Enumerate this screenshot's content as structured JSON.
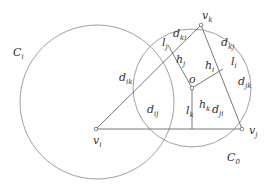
{
  "diagram": {
    "colors": {
      "stroke": "#555555",
      "circle": "#888888",
      "text": "#333333",
      "background": "#ffffff"
    },
    "circles": [
      {
        "id": "C_i",
        "label": "C",
        "sub": "i",
        "cx": 97,
        "cy": 102,
        "r": 77
      },
      {
        "id": "C_0",
        "label": "C",
        "sub": "0",
        "cx": 192,
        "cy": 88,
        "r": 59
      }
    ],
    "vertices": {
      "v_i": {
        "label": "v",
        "sub": "i",
        "x": 96,
        "y": 129
      },
      "v_j": {
        "label": "v",
        "sub": "j",
        "x": 242,
        "y": 129
      },
      "v_k": {
        "label": "v",
        "sub": "k",
        "x": 201,
        "y": 25
      },
      "o": {
        "label": "o",
        "sub": "",
        "x": 192,
        "y": 88
      }
    },
    "labels": [
      {
        "key": "C_i",
        "main": "C",
        "sub": "i",
        "x": 13,
        "y": 56
      },
      {
        "key": "C_0",
        "main": "C",
        "sub": "0",
        "x": 227,
        "y": 161
      },
      {
        "key": "v_k",
        "main": "v",
        "sub": "k",
        "x": 202,
        "y": 19
      },
      {
        "key": "v_j",
        "main": "v",
        "sub": "j",
        "x": 249,
        "y": 134
      },
      {
        "key": "v_i",
        "main": "v",
        "sub": "i",
        "x": 93,
        "y": 144
      },
      {
        "key": "o",
        "main": "o",
        "sub": "",
        "x": 189,
        "y": 83
      },
      {
        "key": "d_ik",
        "main": "d",
        "sub": "ik",
        "x": 119,
        "y": 81
      },
      {
        "key": "d_ki",
        "main": "d",
        "sub": "ki",
        "x": 173,
        "y": 37
      },
      {
        "key": "l_j",
        "main": "l",
        "sub": "j",
        "x": 162,
        "y": 46
      },
      {
        "key": "h_j",
        "main": "h",
        "sub": "j",
        "x": 176,
        "y": 63
      },
      {
        "key": "h_i",
        "main": "h",
        "sub": "i",
        "x": 205,
        "y": 69
      },
      {
        "key": "d_kj",
        "main": "d",
        "sub": "kj",
        "x": 221,
        "y": 46
      },
      {
        "key": "l_i",
        "main": "l",
        "sub": "i",
        "x": 231,
        "y": 65
      },
      {
        "key": "d_jk",
        "main": "d",
        "sub": "jk",
        "x": 238,
        "y": 85
      },
      {
        "key": "h_k",
        "main": "h",
        "sub": "k",
        "x": 199,
        "y": 108
      },
      {
        "key": "d_ij",
        "main": "d",
        "sub": "ij",
        "x": 147,
        "y": 113
      },
      {
        "key": "l_k",
        "main": "l",
        "sub": "k",
        "x": 186,
        "y": 114
      },
      {
        "key": "d_ji",
        "main": "d",
        "sub": "ji",
        "x": 212,
        "y": 113
      }
    ],
    "segments": [
      {
        "from": "v_i",
        "to": "v_k"
      },
      {
        "from": "v_k",
        "to": "v_j"
      },
      {
        "from": "v_i",
        "to": "v_j"
      },
      {
        "from": "o",
        "to": "foot_j",
        "fx": 168,
        "fy": 45
      },
      {
        "from": "o",
        "to": "foot_i",
        "fx": 223,
        "fy": 69
      },
      {
        "from": "o",
        "to": "foot_k",
        "fx": 192,
        "fy": 129
      }
    ]
  }
}
